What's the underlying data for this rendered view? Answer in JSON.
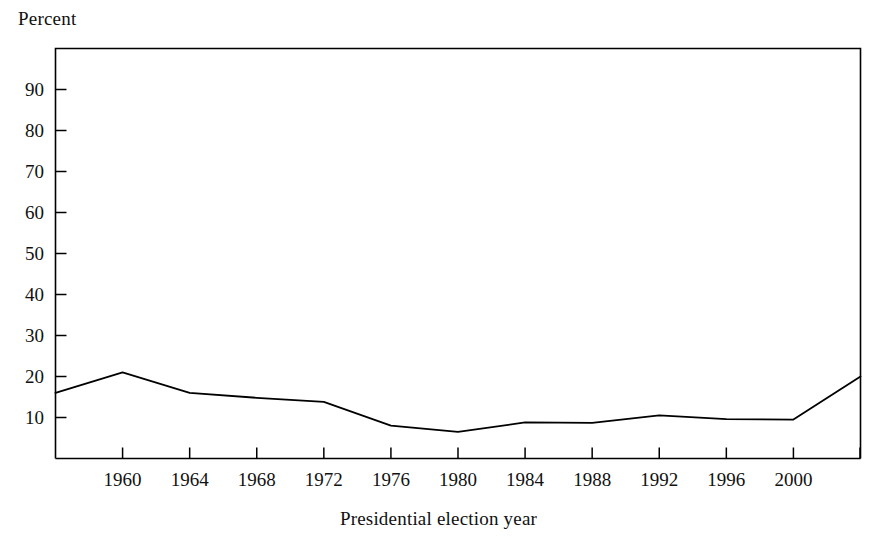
{
  "chart_data": {
    "type": "line",
    "title": "",
    "xlabel": "Presidential election year",
    "ylabel": "Percent",
    "ylim": [
      0,
      100
    ],
    "xlim": [
      1956,
      2004
    ],
    "grid": false,
    "legend": null,
    "ytick_labels": [
      "90",
      "80",
      "70",
      "60",
      "50",
      "40",
      "30",
      "20",
      "10"
    ],
    "ytick_values": [
      90,
      80,
      70,
      60,
      50,
      40,
      30,
      20,
      10
    ],
    "xtick_labels": [
      "1960",
      "1964",
      "1968",
      "1972",
      "1976",
      "1980",
      "1984",
      "1988",
      "1992",
      "1996",
      "2000"
    ],
    "xtick_values": [
      1960,
      1964,
      1968,
      1972,
      1976,
      1980,
      1984,
      1988,
      1992,
      1996,
      2000
    ],
    "x": [
      1956,
      1960,
      1964,
      1968,
      1972,
      1976,
      1980,
      1984,
      1988,
      1992,
      1996,
      2000,
      2004
    ],
    "values": [
      16.0,
      21.0,
      16.0,
      14.8,
      13.8,
      8.0,
      6.5,
      8.8,
      8.7,
      10.5,
      9.6,
      9.5,
      20.0
    ],
    "series": [
      {
        "name": "Percent",
        "color": "#000000",
        "values": [
          16.0,
          21.0,
          16.0,
          14.8,
          13.8,
          8.0,
          6.5,
          8.8,
          8.7,
          10.5,
          9.6,
          9.5,
          20.0
        ]
      }
    ]
  },
  "axes": {
    "y_title": "Percent",
    "x_title": "Presidential election year"
  },
  "colors": {
    "line": "#000000",
    "frame": "#000000",
    "background": "#ffffff"
  }
}
